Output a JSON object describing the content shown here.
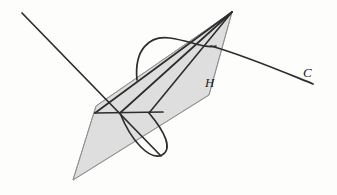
{
  "figure": {
    "background_color": "#fdfdfc",
    "width": 337,
    "height": 195,
    "labels": [
      {
        "id": "H",
        "text": "H",
        "x": 205,
        "y": 76,
        "style": "italic",
        "meaning": "plane-H-label"
      },
      {
        "id": "C",
        "text": "C",
        "x": 303,
        "y": 66,
        "style": "italic",
        "meaning": "curve-C-label"
      }
    ],
    "colors": {
      "stroke": "#2a2a2a",
      "thin_stroke": "#6e6e6e",
      "plane_fill": "#dedede",
      "plane_edge": "#8c8c8c",
      "background": "#fdfdfc"
    },
    "elements": {
      "plane_H": {
        "name": "shaded-parallelogram-H",
        "points": "232,12 209,95 73,180 96,106",
        "fill": "#dedede",
        "stroke": "#8c8c8c"
      },
      "ray_from_upper_left": {
        "name": "line-upper-left-to-plane",
        "x1": 22,
        "y1": 13,
        "x2": 160,
        "y2": 155
      },
      "long_edge_upper": {
        "name": "line-apex-to-left-vertex",
        "x1": 232,
        "y1": 12,
        "x2": 96,
        "y2": 113
      },
      "long_edge_lower": {
        "name": "line-apex-to-lower-cone",
        "x1": 232,
        "y1": 12,
        "x2": 148,
        "y2": 113
      },
      "horizontal_chord": {
        "name": "horizontal-chord",
        "x1": 96,
        "y1": 113,
        "x2": 162,
        "y2": 112
      },
      "curve_C": {
        "name": "curve-C-path",
        "d": "M 212,47 C 248,57 282,72 313,83"
      },
      "arc_marker": {
        "name": "angle-arc-marker",
        "d": "M 137,79 C 135,47 152,35 171,38 C 192,41 206,50 215,47"
      },
      "cone_lower_curve": {
        "name": "lower-cone-ellipse-arc",
        "d": "M 120,113 C 133,142 152,160 163,154 C 172,148 166,133 148,113"
      }
    }
  }
}
